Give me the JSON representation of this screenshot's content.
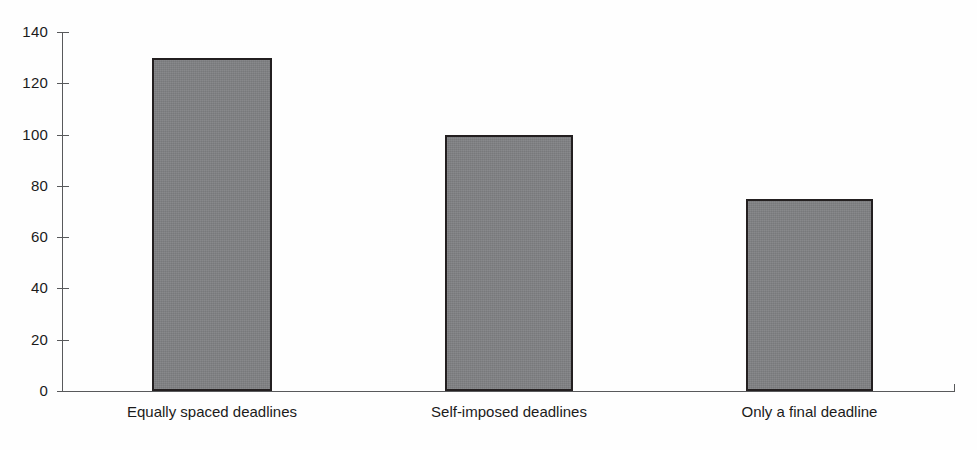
{
  "chart_data": {
    "type": "bar",
    "title": "",
    "subtitle": "",
    "xlabel": "",
    "ylabel": "",
    "categories": [
      "Equally spaced deadlines",
      "Self-imposed deadlines",
      "Only a final deadline"
    ],
    "values": [
      130,
      100,
      75
    ],
    "ylim": [
      0,
      140
    ],
    "ytick_labels": [
      "0",
      "20",
      "40",
      "60",
      "80",
      "100",
      "120",
      "140"
    ],
    "ytick_values": [
      0,
      20,
      40,
      60,
      80,
      100,
      120,
      140
    ],
    "grid": false,
    "legend": false,
    "legend_position": "none",
    "series": [
      {
        "name": "",
        "values": [
          130,
          100,
          75
        ]
      }
    ],
    "colors": {
      "bar_fill": "#808184",
      "bar_border": "#231f20",
      "axis": "#58595b",
      "text": "#1b1b1b",
      "background": "#fefefe"
    }
  }
}
